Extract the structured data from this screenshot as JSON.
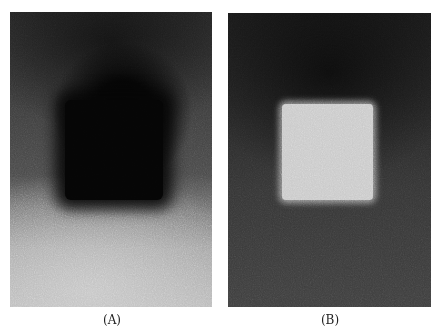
{
  "figure": {
    "panels": [
      {
        "id": "A",
        "label": "(A)",
        "description": "Grainy micrograph with dark square region in center; darker background on top, lighter at bottom",
        "feature": "dark-square"
      },
      {
        "id": "B",
        "label": "(B)",
        "description": "Grainy micrograph with bright square region in center on dark speckled background",
        "feature": "bright-square"
      }
    ]
  }
}
